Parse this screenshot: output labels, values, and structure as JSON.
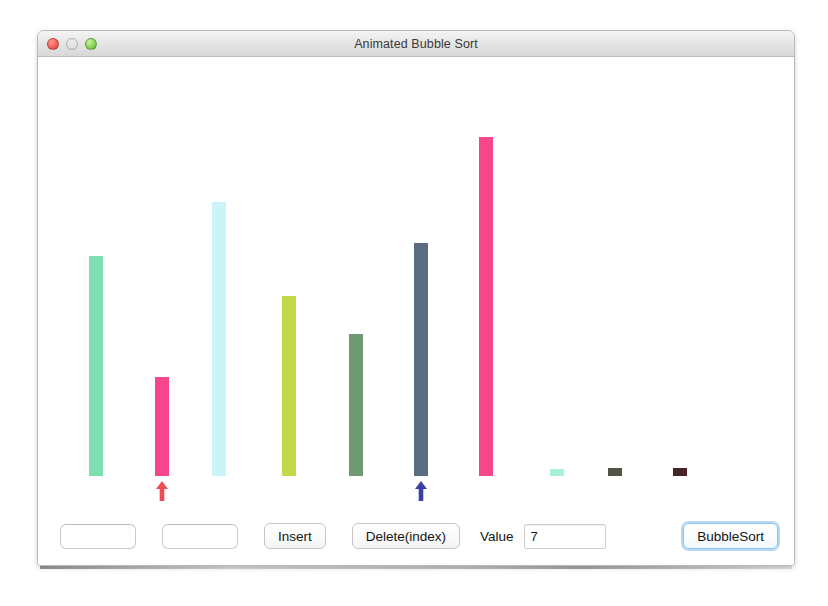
{
  "window": {
    "title": "Animated Bubble Sort",
    "traffic_lights": [
      {
        "name": "close",
        "color": "#f4625a"
      },
      {
        "name": "minimize",
        "color": "#f2ba3c"
      },
      {
        "name": "maximize",
        "color": "#89d453"
      }
    ]
  },
  "toolbar": {
    "field1_value": "",
    "field1_placeholder": "",
    "field2_value": "",
    "field2_placeholder": "",
    "insert_label": "Insert",
    "delete_label": "Delete(index)",
    "value_label": "Value",
    "value_input": "7",
    "bubblesort_label": "BubbleSort"
  },
  "chart_data": {
    "type": "bar",
    "title": "Animated Bubble Sort",
    "xlabel": "",
    "ylabel": "",
    "grid": false,
    "legend": null,
    "ylim": [
      0,
      345
    ],
    "categories": [
      "0",
      "1",
      "2",
      "3",
      "4",
      "5",
      "6",
      "7",
      "8",
      "9"
    ],
    "values": [
      221,
      100,
      276,
      181,
      143,
      234,
      341,
      7,
      8,
      8
    ],
    "colors": [
      "#7ee0b0",
      "#f8468c",
      "#cbf3f8",
      "#c3d94a",
      "#6f9971",
      "#5a6b82",
      "#f8468c",
      "#a8f0dd",
      "#4f5543",
      "#45252a"
    ],
    "bar_width": 14,
    "bar_x": [
      51,
      117,
      174,
      244,
      311,
      376,
      441,
      512,
      570,
      635
    ],
    "markers": [
      {
        "name": "compare-pointer-red",
        "index": 1,
        "color": "#ef4b52",
        "symbol": "up-arrow"
      },
      {
        "name": "compare-pointer-blue",
        "index": 5,
        "color": "#3b3fa6",
        "symbol": "up-arrow"
      }
    ]
  }
}
